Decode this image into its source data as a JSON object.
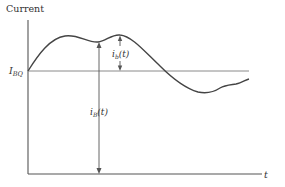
{
  "diagram": {
    "y_axis_label": "Current",
    "x_axis_label": "t",
    "baseline_label": {
      "main": "I",
      "sub": "BQ"
    },
    "total_current_label": {
      "main": "i",
      "sub": "B",
      "arg": "(t)"
    },
    "ac_current_label": {
      "main": "i",
      "sub": "b",
      "arg": "(t)"
    },
    "colors": {
      "axis": "#555555",
      "baseline": "#8a8a8a",
      "curve": "#444444",
      "text": "#333333"
    }
  }
}
